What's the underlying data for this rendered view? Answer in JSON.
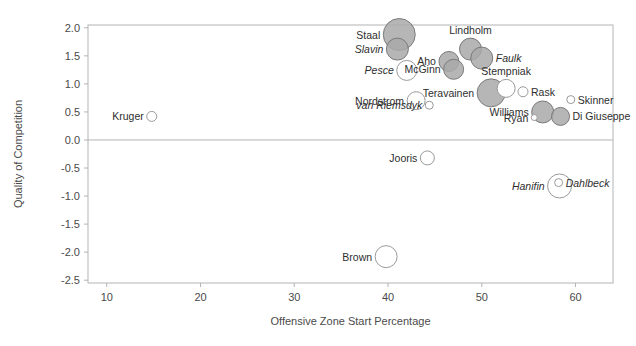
{
  "chart_data": {
    "type": "scatter",
    "title": "",
    "subtitle": "",
    "xlabel": "Offensive Zone Start Percentage",
    "ylabel": "Quality of Competition",
    "xlim": [
      8.0,
      64.0
    ],
    "ylim": [
      -2.55,
      2.05
    ],
    "xticks": [
      10,
      20,
      30,
      40,
      50,
      60
    ],
    "xtick_labels": [
      "10",
      "20",
      "30",
      "40",
      "50",
      "60"
    ],
    "yticks": [
      2.0,
      1.5,
      1.0,
      0.5,
      0.0,
      -0.5,
      -1.0,
      -1.5,
      -2.0,
      -2.5
    ],
    "ytick_labels": [
      "2.0",
      "1.5",
      "1.0",
      "0.5",
      "0.0",
      "-0.5",
      "-1.0",
      "-1.5",
      "-2.0",
      "-2.5"
    ],
    "grid": false,
    "zero_line": true,
    "legend": "none",
    "marker_note": "bubble size encodes a third variable; filled gray markers vs open white markers; italic labels denote a distinct group (defensemen)",
    "colors": {
      "bubble_fill": "#a9a9a9",
      "bubble_stroke": "#7a7a7a",
      "open_fill": "#ffffff",
      "open_stroke": "#9a9a9a",
      "axis": "#b4b4b4",
      "text": "#3a3a3a"
    },
    "points": [
      {
        "name": "Staal",
        "x": 41.2,
        "y": 1.88,
        "r": 16,
        "filled": true,
        "italic": false,
        "label_pos": "left"
      },
      {
        "name": "Slavin",
        "x": 41.0,
        "y": 1.62,
        "r": 11,
        "filled": true,
        "italic": true,
        "label_pos": "left"
      },
      {
        "name": "Lindholm",
        "x": 48.8,
        "y": 1.62,
        "r": 11,
        "filled": true,
        "italic": false,
        "label_pos": "above"
      },
      {
        "name": "Faulk",
        "x": 50.0,
        "y": 1.46,
        "r": 11,
        "filled": true,
        "italic": true,
        "label_pos": "right"
      },
      {
        "name": "Aho",
        "x": 46.5,
        "y": 1.4,
        "r": 10,
        "filled": true,
        "italic": false,
        "label_pos": "left"
      },
      {
        "name": "McGinn",
        "x": 47.0,
        "y": 1.26,
        "r": 10,
        "filled": true,
        "italic": false,
        "label_pos": "left"
      },
      {
        "name": "Pesce",
        "x": 42.0,
        "y": 1.24,
        "r": 10,
        "filled": false,
        "italic": true,
        "label_pos": "left"
      },
      {
        "name": "Stempniak",
        "x": 52.6,
        "y": 0.92,
        "r": 9,
        "filled": false,
        "italic": false,
        "label_pos": "above"
      },
      {
        "name": "Rask",
        "x": 54.4,
        "y": 0.86,
        "r": 5,
        "filled": false,
        "italic": false,
        "label_pos": "right"
      },
      {
        "name": "Skinner",
        "x": 59.5,
        "y": 0.72,
        "r": 4,
        "filled": false,
        "italic": false,
        "label_pos": "right"
      },
      {
        "name": "Teravainen",
        "x": 51.0,
        "y": 0.84,
        "r": 14,
        "filled": true,
        "italic": false,
        "label_pos": "left"
      },
      {
        "name": "Nordstrom",
        "x": 43.0,
        "y": 0.7,
        "r": 9,
        "filled": false,
        "italic": false,
        "label_pos": "left"
      },
      {
        "name": "van Riemsdyk",
        "x": 44.4,
        "y": 0.62,
        "r": 4,
        "filled": false,
        "italic": true,
        "label_pos": "left"
      },
      {
        "name": "Williams",
        "x": 56.5,
        "y": 0.5,
        "r": 11,
        "filled": true,
        "italic": false,
        "label_pos": "left"
      },
      {
        "name": "Di Giuseppe",
        "x": 58.4,
        "y": 0.42,
        "r": 9,
        "filled": true,
        "italic": false,
        "label_pos": "right"
      },
      {
        "name": "Ryan",
        "x": 55.6,
        "y": 0.4,
        "r": 3,
        "filled": false,
        "italic": false,
        "label_pos": "left"
      },
      {
        "name": "Kruger",
        "x": 14.8,
        "y": 0.42,
        "r": 5,
        "filled": false,
        "italic": false,
        "label_pos": "left"
      },
      {
        "name": "Jooris",
        "x": 44.2,
        "y": -0.32,
        "r": 7,
        "filled": false,
        "italic": false,
        "label_pos": "left"
      },
      {
        "name": "Hanifin",
        "x": 58.3,
        "y": -0.82,
        "r": 12,
        "filled": false,
        "italic": true,
        "label_pos": "left"
      },
      {
        "name": "Dahlbeck",
        "x": 58.2,
        "y": -0.76,
        "r": 4,
        "filled": false,
        "italic": true,
        "label_pos": "right"
      },
      {
        "name": "Brown",
        "x": 39.8,
        "y": -2.08,
        "r": 11,
        "filled": false,
        "italic": false,
        "label_pos": "left"
      }
    ]
  }
}
